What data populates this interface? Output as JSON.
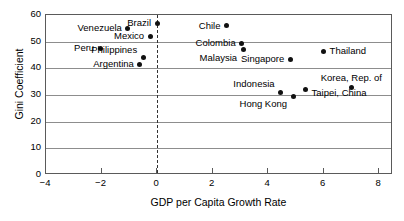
{
  "chart_data": {
    "type": "scatter",
    "title": "",
    "xlabel": "GDP per Capita Growth Rate",
    "ylabel": "Gini Coefficient",
    "xlim": [
      -4,
      8.5
    ],
    "ylim": [
      0,
      60
    ],
    "xticks": [
      -4,
      -2,
      0,
      2,
      4,
      6,
      8
    ],
    "xtick_labels": [
      "−4",
      "−2",
      "0",
      "2",
      "4",
      "6",
      "8"
    ],
    "yticks": [
      0,
      10,
      20,
      30,
      40,
      50,
      60
    ],
    "ytick_labels": [
      "0",
      "10",
      "20",
      "30",
      "40",
      "50",
      "60"
    ],
    "grid": "horizontal",
    "legend": "none",
    "annotations": [
      {
        "type": "vline",
        "x": 0,
        "style": "dashed",
        "label": "zero-growth reference line"
      }
    ],
    "points": [
      {
        "label": "Venezuela",
        "x": -1.05,
        "y": 55.0,
        "label_pos": "left"
      },
      {
        "label": "Brazil",
        "x": 0.0,
        "y": 57.0,
        "label_pos": "left"
      },
      {
        "label": "Mexico",
        "x": -0.25,
        "y": 52.0,
        "label_pos": "left"
      },
      {
        "label": "Peru",
        "x": -2.05,
        "y": 47.5,
        "label_pos": "left"
      },
      {
        "label": "Philippines",
        "x": -0.5,
        "y": 44.0,
        "label_pos": "above-left"
      },
      {
        "label": "Argentina",
        "x": -0.62,
        "y": 41.5,
        "label_pos": "left"
      },
      {
        "label": "Chile",
        "x": 2.5,
        "y": 56.0,
        "label_pos": "left"
      },
      {
        "label": "Colombia",
        "x": 3.05,
        "y": 49.5,
        "label_pos": "left"
      },
      {
        "label": "Malaysia",
        "x": 3.1,
        "y": 47.0,
        "label_pos": "below-left"
      },
      {
        "label": "Singapore",
        "x": 4.8,
        "y": 43.5,
        "label_pos": "left"
      },
      {
        "label": "Thailand",
        "x": 6.0,
        "y": 46.5,
        "label_pos": "right"
      },
      {
        "label": "Indonesia",
        "x": 4.45,
        "y": 31.0,
        "label_pos": "above-left"
      },
      {
        "label": "Taipei, China",
        "x": 5.35,
        "y": 32.0,
        "label_pos": "below-right"
      },
      {
        "label": "Korea, Rep. of",
        "x": 7.0,
        "y": 33.0,
        "label_pos": "above"
      },
      {
        "label": "Hong Kong",
        "x": 4.9,
        "y": 29.5,
        "label_pos": "below-left"
      }
    ]
  },
  "colors": {
    "point": "#111111",
    "grid": "#8d8d8d",
    "frame": "#5a5a5a",
    "background": "#ffffff",
    "text": "#000000"
  }
}
